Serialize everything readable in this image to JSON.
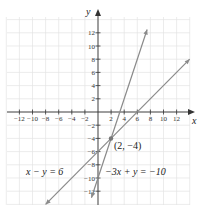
{
  "chart_data": {
    "type": "line",
    "title": "",
    "xlabel": "x",
    "ylabel": "y",
    "xlim": [
      -14,
      14
    ],
    "ylim": [
      -14,
      14
    ],
    "grid": true,
    "x_ticks": [
      -12,
      -10,
      -8,
      -6,
      -4,
      -2,
      2,
      4,
      6,
      8,
      10,
      12
    ],
    "y_ticks": [
      -12,
      -10,
      -8,
      -6,
      -4,
      -2,
      2,
      4,
      6,
      8,
      10,
      12
    ],
    "x_tick_labels": [
      "−12",
      "−10",
      "−8",
      "−6",
      "−4",
      "−2",
      "2",
      "4",
      "6",
      "8",
      "10",
      "12"
    ],
    "y_tick_labels_pos": [
      "2",
      "4",
      "6",
      "8",
      "10",
      "12"
    ],
    "y_tick_labels_neg": [
      "−2",
      "−4",
      "−6",
      "−8",
      "−10",
      "−12"
    ],
    "series": [
      {
        "name": "x − y = 6",
        "equation": "y = x - 6",
        "x": [
          -8,
          14
        ],
        "y": [
          -14,
          8
        ],
        "color": "#8a8a8a"
      },
      {
        "name": "−3x + y = −10",
        "equation": "y = 3x - 10",
        "x": [
          -1,
          7.5
        ],
        "y": [
          -13,
          12.5
        ],
        "color": "#8a8a8a"
      }
    ],
    "annotations": [
      {
        "text": "(2, −4)",
        "x": 2,
        "y": -4,
        "type": "intersection-point"
      },
      {
        "text": "x − y = 6",
        "target": "series.0"
      },
      {
        "text": "−3x + y = −10",
        "target": "series.1"
      }
    ]
  },
  "labels": {
    "x_axis": "x",
    "y_axis": "y",
    "point": "(2, −4)",
    "eq1": "x − y = 6",
    "eq2": "−3x + y = −10"
  }
}
